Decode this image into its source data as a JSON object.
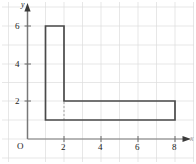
{
  "figure": {
    "kind": "coordinate-grid-plot",
    "background_color": "#ffffff",
    "grid": {
      "visible": true,
      "color": "#d8d8d8",
      "minor_color": "#ececec",
      "step": 1
    },
    "axes": {
      "color": "#6b6b6b",
      "x_axis": {
        "label": "x",
        "arrow": "right",
        "range": [
          -0.5,
          9
        ],
        "tick_labels": [
          "2",
          "4",
          "6",
          "8"
        ],
        "tick_values": [
          2,
          4,
          6,
          8
        ]
      },
      "y_axis": {
        "label": "y",
        "arrow": "up",
        "range": [
          -1,
          7.5
        ],
        "tick_labels": [
          "2",
          "4",
          "6"
        ],
        "tick_values": [
          2,
          4,
          6
        ]
      },
      "origin_label": "O"
    },
    "shape": {
      "name": "L-shaped-polygon",
      "stroke_color": "#4a4a4a",
      "stroke_width": 1.6,
      "fill": "none",
      "vertices": [
        [
          1,
          1
        ],
        [
          1,
          6
        ],
        [
          2,
          6
        ],
        [
          2,
          2
        ],
        [
          8,
          2
        ],
        [
          8,
          1
        ]
      ],
      "closed": true
    },
    "dashed_segment": {
      "name": "interior-dashed-line",
      "color": "#b0b0b0",
      "from": [
        2,
        1
      ],
      "to": [
        2,
        2
      ],
      "dash": "2 2"
    }
  }
}
